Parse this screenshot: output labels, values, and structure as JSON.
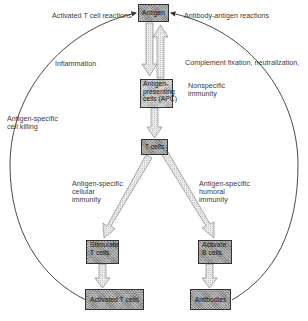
{
  "diagram": {
    "type": "flow",
    "top_labels": {
      "left": "Activated T cell reactions",
      "right": "Antibody-antigen reactions"
    },
    "nodes": {
      "antigen": "Antigen",
      "apc_line1": "Antigen-",
      "apc_line2": "presenting",
      "apc_line3": "cells (APC)",
      "tcells": "T cells",
      "stimulate_line1": "Stimulate",
      "stimulate_line2": "T cells",
      "activateb_line1": "Activate",
      "activateb_line2": "B cells",
      "activated_t": "Activated T cells",
      "antibodies": "Antibodies"
    },
    "edge_labels": {
      "inflammation": "Inflammation",
      "complement": "Complement fixation, neutralization,",
      "nonspecific_line1": "Nonspecific",
      "nonspecific_line2": "immunity",
      "cell_killing_line1": "Antigen-specific",
      "cell_killing_line2": "cell killing",
      "cellular_line1": "Antigen-specific",
      "cellular_line2": "cellular",
      "cellular_line3": "immunity",
      "humoral_line1": "Antigen-specific",
      "humoral_line2": "humoral",
      "humoral_line3": "immunity"
    },
    "edges": [
      {
        "from": "Antigen",
        "to": "Antigen-presenting cells (APC)"
      },
      {
        "from": "Antigen-presenting cells (APC)",
        "to": "Antigen"
      },
      {
        "from": "Antigen-presenting cells (APC)",
        "to": "T cells"
      },
      {
        "from": "T cells",
        "to": "Stimulate T cells"
      },
      {
        "from": "T cells",
        "to": "Activate B cells"
      },
      {
        "from": "Stimulate T cells",
        "to": "Activated T cells"
      },
      {
        "from": "Activate B cells",
        "to": "Antibodies"
      },
      {
        "from": "Activated T cells",
        "to": "Antigen",
        "style": "curved"
      },
      {
        "from": "Antibodies",
        "to": "Antigen",
        "style": "curved"
      }
    ],
    "colors": {
      "box_fill": "#9a9a9a",
      "box_border": "#333333",
      "arrow_fill": "#e0e0e0",
      "line": "#333333"
    }
  }
}
